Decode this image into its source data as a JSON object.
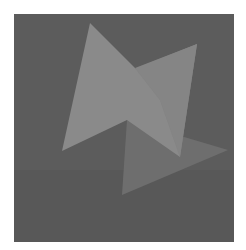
{
  "image": {
    "description": "Abstract composition of overlapping light-gray triangles on a dark gray square",
    "colors": {
      "page_background": "#ffffff",
      "square": "#5c5c5c",
      "square_lower": "#585858",
      "triangle_main": "#8a8a8a",
      "triangle_right": "#828282",
      "triangle_lower": "#6e6e6e"
    },
    "square": {
      "x": 14,
      "y": 14,
      "width": 220,
      "height": 228
    },
    "shapes": [
      {
        "name": "triangle-main",
        "points": "90,23 62,151 180,157"
      },
      {
        "name": "triangle-right",
        "points": "197,44 127,72 180,157"
      },
      {
        "name": "triangle-lower",
        "points": "127,120 122,195 228,150"
      }
    ]
  }
}
